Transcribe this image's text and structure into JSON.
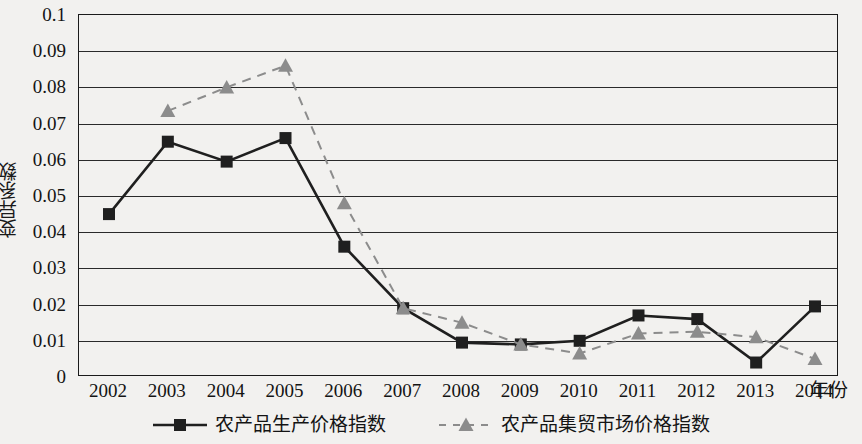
{
  "chart_data": {
    "type": "line",
    "title": "",
    "xlabel": "年份",
    "ylabel": "变异系数",
    "grid": true,
    "legend_position": "bottom",
    "categories": [
      "2002",
      "2003",
      "2004",
      "2005",
      "2006",
      "2007",
      "2008",
      "2009",
      "2010",
      "2011",
      "2012",
      "2013",
      "2014"
    ],
    "x": [
      2002,
      2003,
      2004,
      2005,
      2006,
      2007,
      2008,
      2009,
      2010,
      2011,
      2012,
      2013,
      2014
    ],
    "ylim": [
      0,
      0.1
    ],
    "xlim": [
      2002,
      2014
    ],
    "y_ticks": [
      "0",
      "0.01",
      "0.02",
      "0.03",
      "0.04",
      "0.05",
      "0.06",
      "0.07",
      "0.08",
      "0.09",
      "0.1"
    ],
    "y_tick_values": [
      0,
      0.01,
      0.02,
      0.03,
      0.04,
      0.05,
      0.06,
      0.07,
      0.08,
      0.09,
      0.1
    ],
    "series": [
      {
        "name": "农产品生产价格指数",
        "marker": "square",
        "line_style": "solid",
        "color": "#1f1f1f",
        "values": [
          0.045,
          0.065,
          0.0595,
          0.066,
          0.036,
          0.019,
          0.0095,
          0.009,
          0.01,
          0.017,
          0.016,
          0.004,
          0.0195
        ]
      },
      {
        "name": "农产品集贸市场价格指数",
        "marker": "triangle",
        "line_style": "dashed",
        "color": "#8c8c8c",
        "values": [
          null,
          0.0735,
          0.08,
          0.086,
          0.048,
          0.019,
          0.015,
          0.009,
          0.0065,
          0.012,
          0.0125,
          0.011,
          0.005
        ]
      }
    ]
  },
  "axes": {
    "y_title": "变异系数",
    "x_title": "年份"
  },
  "legend": {
    "items": [
      {
        "label": "农产品生产价格指数",
        "marker": "square-marker",
        "color": "#1f1f1f",
        "line_style": "solid"
      },
      {
        "label": "农产品集贸市场价格指数",
        "marker": "triangle-marker",
        "color": "#8c8c8c",
        "line_style": "dashed"
      }
    ]
  },
  "colors": {
    "background": "#f2f1ef",
    "axis": "#1b1b1b",
    "grid": "#2a2a2a",
    "series1": "#1f1f1f",
    "series2": "#8c8c8c"
  }
}
